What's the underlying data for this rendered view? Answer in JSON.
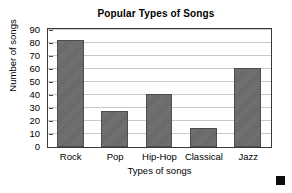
{
  "chart_data": {
    "type": "bar",
    "title": "Popular Types of Songs",
    "xlabel": "Types of songs",
    "ylabel": "Number of songs",
    "categories": [
      "Rock",
      "Pop",
      "Hip-Hop",
      "Classical",
      "Jazz"
    ],
    "values": [
      82,
      28,
      41,
      15,
      61
    ],
    "ylim": [
      0,
      90
    ],
    "ytick_step": 10,
    "yticks": [
      0,
      10,
      20,
      30,
      40,
      50,
      60,
      70,
      80,
      90
    ],
    "ytick_labels": [
      "0",
      "10",
      "20",
      "30",
      "40",
      "50",
      "60",
      "70",
      "80",
      "90"
    ],
    "grid": "horizontal",
    "legend": "none",
    "bar_color": "#6b6b6b",
    "bar_border_color": "#4d4d4d",
    "gridline_color": "#c9c9c9",
    "frame_color": "#3a3a3a",
    "background_color": "#ffffff"
  },
  "marker": {
    "name": "black-square-marker",
    "color": "#0d0d0d"
  }
}
